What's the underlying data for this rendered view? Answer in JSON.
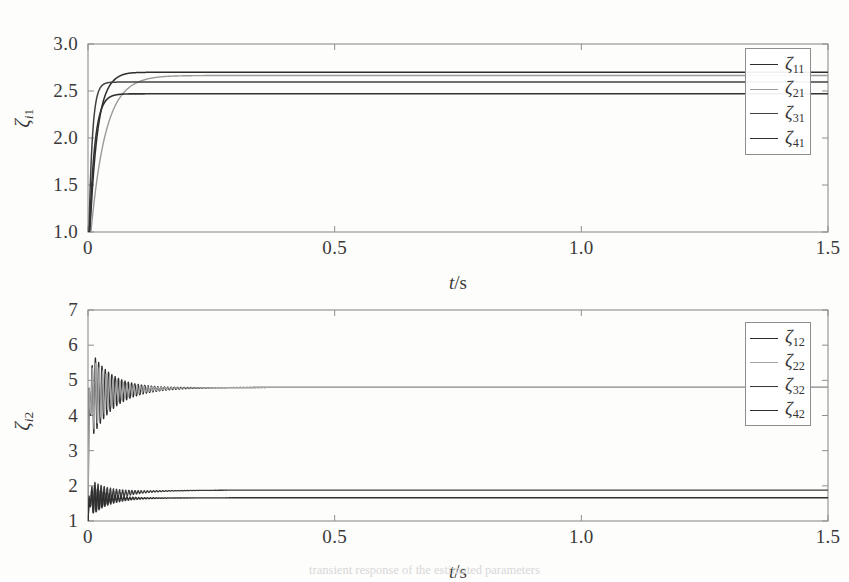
{
  "figure": {
    "background_color": "#fdfdfc",
    "frame_color": "#8e8e8e",
    "caption_partial": "transient response of the estimated parameters"
  },
  "chart_data": [
    {
      "id": "panel-1",
      "type": "line",
      "title": "",
      "xlabel": "t/s",
      "ylabel": "ζi1",
      "xlim": [
        0,
        1.5
      ],
      "ylim": [
        1.0,
        3.0
      ],
      "xticks": [
        0,
        0.5,
        1.0,
        1.5
      ],
      "xtick_labels": [
        "0",
        "0.5",
        "1.0",
        "1.5"
      ],
      "yticks": [
        1.0,
        1.5,
        2.0,
        2.5,
        3.0
      ],
      "ytick_labels": [
        "1.0",
        "1.5",
        "2.0",
        "2.5",
        "3.0"
      ],
      "grid": false,
      "legend_position": "upper-right",
      "series": [
        {
          "name": "ζ11",
          "label_base": "ζ",
          "label_sub": "11",
          "color": "#2d2d2d",
          "width": 1.5,
          "initial": 1.0,
          "steady": 2.7,
          "tau": 0.016,
          "delay": 0.004,
          "overshoot": 0.012
        },
        {
          "name": "ζ21",
          "label_base": "ζ",
          "label_sub": "21",
          "color": "#9a9a9a",
          "width": 1.4,
          "initial": 1.0,
          "steady": 2.665,
          "tau": 0.03,
          "delay": 0.006,
          "overshoot": 0.004
        },
        {
          "name": "ζ31",
          "label_base": "ζ",
          "label_sub": "31",
          "color": "#414141",
          "width": 1.5,
          "initial": 1.0,
          "steady": 2.595,
          "tau": 0.007,
          "delay": 0.002,
          "overshoot": 0.0
        },
        {
          "name": "ζ41",
          "label_base": "ζ",
          "label_sub": "41",
          "color": "#333333",
          "width": 1.6,
          "initial": 1.0,
          "steady": 2.47,
          "tau": 0.011,
          "delay": 0.003,
          "overshoot": 0.0
        }
      ]
    },
    {
      "id": "panel-2",
      "type": "line",
      "title": "",
      "xlabel": "t/s",
      "ylabel": "ζi2",
      "xlim": [
        0,
        1.5
      ],
      "ylim": [
        1,
        7
      ],
      "xticks": [
        0,
        0.5,
        1.0,
        1.5
      ],
      "xtick_labels": [
        "0",
        "0.5",
        "1.0",
        "1.5"
      ],
      "yticks": [
        1,
        2,
        3,
        4,
        5,
        6,
        7
      ],
      "ytick_labels": [
        "1",
        "2",
        "3",
        "4",
        "5",
        "6",
        "7"
      ],
      "grid": false,
      "legend_position": "upper-right",
      "series": [
        {
          "name": "ζ12",
          "label_base": "ζ",
          "label_sub": "12",
          "color": "#2d2d2d",
          "width": 1.3,
          "group": "upper",
          "initial": 1.0,
          "steady": 4.8,
          "osc_center": 4.55,
          "osc_amp": 1.45,
          "osc_freq": 150,
          "decay": 22,
          "settle_time": 0.16
        },
        {
          "name": "ζ22",
          "label_base": "ζ",
          "label_sub": "22",
          "color": "#a5a5a5",
          "width": 1.2,
          "group": "upper",
          "initial": 1.0,
          "steady": 4.8,
          "osc_center": 4.55,
          "osc_amp": 1.3,
          "osc_freq": 143,
          "decay": 24,
          "settle_time": 0.15
        },
        {
          "name": "ζ32",
          "label_base": "ζ",
          "label_sub": "32",
          "color": "#3b3b3b",
          "width": 1.3,
          "group": "lower",
          "initial": 1.0,
          "steady": 1.88,
          "osc_center": 1.62,
          "osc_amp": 0.62,
          "osc_freq": 160,
          "decay": 26,
          "settle_time": 0.14
        },
        {
          "name": "ζ42",
          "label_base": "ζ",
          "label_sub": "42",
          "color": "#2f2f2f",
          "width": 1.4,
          "group": "lower",
          "initial": 1.0,
          "steady": 1.66,
          "osc_center": 1.58,
          "osc_amp": 0.55,
          "osc_freq": 168,
          "decay": 30,
          "settle_time": 0.13
        }
      ],
      "annotations": [
        {
          "text": "upper band oscillates between ≈3 and ≈6 before settling near 4.8"
        },
        {
          "text": "lower band oscillates between ≈1 and ≈2.2 before settling near 1.7"
        }
      ]
    }
  ]
}
